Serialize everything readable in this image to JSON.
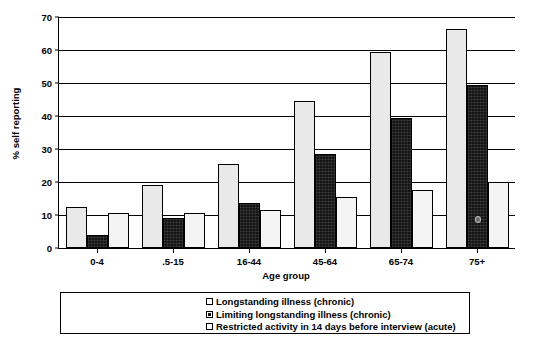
{
  "chart_data": {
    "type": "bar",
    "title": "",
    "xlabel": "Age group",
    "ylabel": "% self reporting",
    "ylim": [
      0,
      70
    ],
    "yticks": [
      0,
      10,
      20,
      30,
      40,
      50,
      60,
      70
    ],
    "grid": true,
    "legend_position": "bottom",
    "categories": [
      "0-4",
      ".5-15",
      "16-44",
      "45-64",
      "65-74",
      "75+"
    ],
    "series": [
      {
        "name": "Longstanding illness (chronic)",
        "values": [
          12.5,
          19,
          25.5,
          44.5,
          59.5,
          66.5
        ]
      },
      {
        "name": "Limiting longstanding illness (chronic)",
        "values": [
          4,
          9,
          13.5,
          28.5,
          39.5,
          49.5
        ]
      },
      {
        "name": "Restricted activity in 14 days before interview (acute)",
        "values": [
          10.5,
          10.5,
          11.5,
          15.5,
          17.5,
          20
        ]
      }
    ]
  },
  "axis": {
    "y_title": "% self reporting",
    "x_title": "Age group",
    "y_tick_labels": [
      "0",
      "10",
      "20",
      "30",
      "40",
      "50",
      "60",
      "70"
    ],
    "x_tick_labels": [
      "0-4",
      ".5-15",
      "16-44",
      "45-64",
      "65-74",
      "75+"
    ]
  },
  "legend": {
    "items": [
      {
        "label": "Longstanding illness (chronic)",
        "swatch": "s1"
      },
      {
        "label": "Limiting longstanding illness (chronic)",
        "swatch": "s2"
      },
      {
        "label": "Restricted activity in 14 days before interview (acute)",
        "swatch": "s3"
      }
    ]
  },
  "colors": {
    "series1": "#e9e9e9",
    "series2": "#141414",
    "series3": "#f4f4f4",
    "axis": "#000000",
    "background": "#ffffff"
  }
}
